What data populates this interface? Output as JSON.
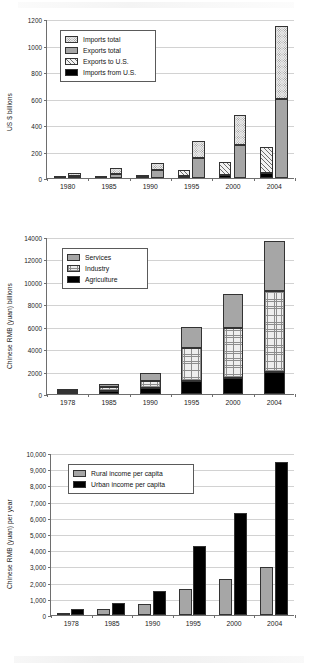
{
  "page": {
    "figure_count": 3
  },
  "chart_data": [
    {
      "id": "chart-trade",
      "type": "bar",
      "title": "",
      "xlabel": "",
      "ylabel": "US $ billions",
      "ylim": [
        0,
        1200
      ],
      "yticks": [
        0,
        200,
        400,
        600,
        800,
        1000,
        1200
      ],
      "ytick_labels": [
        "0",
        "200",
        "400",
        "600",
        "800",
        "1000",
        "1200"
      ],
      "grid": true,
      "legend_position": "upper-left",
      "categories": [
        "1980",
        "1985",
        "1990",
        "1995",
        "2000",
        "2004"
      ],
      "groups": [
        {
          "name": "US bilateral trade",
          "stacked": true,
          "series": [
            {
              "name": "Imports from U.S.",
              "pattern": "solid-black",
              "color": "#000000",
              "values": [
                1,
                3,
                5,
                16,
                22,
                38
              ]
            },
            {
              "name": "Exports to U.S.",
              "pattern": "diagonal-hatch",
              "color": "#f2f2f2",
              "values": [
                1,
                2,
                18,
                45,
                100,
                195
              ]
            }
          ]
        },
        {
          "name": "Total trade",
          "stacked": true,
          "series": [
            {
              "name": "Exports total",
              "pattern": "solid-gray",
              "color": "#a6a6a6",
              "values": [
                18,
                27,
                62,
                149,
                249,
                593
              ]
            },
            {
              "name": "Imports total",
              "pattern": "fine-dots",
              "color": "#ededed",
              "values": [
                20,
                45,
                53,
                132,
                225,
                553
              ]
            }
          ]
        }
      ],
      "legend_entries": [
        {
          "label": "Imports total",
          "pattern": "fine-dots"
        },
        {
          "label": "Exports total",
          "pattern": "solid-gray"
        },
        {
          "label": "Exports to U.S.",
          "pattern": "diagonal-hatch"
        },
        {
          "label": "Imports from U.S.",
          "pattern": "solid-black"
        }
      ]
    },
    {
      "id": "chart-gdp-sector",
      "type": "bar",
      "title": "",
      "xlabel": "",
      "ylabel": "Chinese RMB (yuan) billions",
      "ylim": [
        0,
        14000
      ],
      "yticks": [
        0,
        2000,
        4000,
        6000,
        8000,
        10000,
        12000,
        14000
      ],
      "ytick_labels": [
        "0",
        "2000",
        "4000",
        "6000",
        "8000",
        "10000",
        "12000",
        "14000"
      ],
      "grid": true,
      "legend_position": "upper-left",
      "categories": [
        "1978",
        "1985",
        "1990",
        "1995",
        "2000",
        "2004"
      ],
      "stacked": true,
      "series": [
        {
          "name": "Agriculture",
          "pattern": "solid-black",
          "color": "#000000",
          "values": [
            100,
            255,
            500,
            1200,
            1390,
            1920
          ]
        },
        {
          "name": "Industry",
          "pattern": "grid-hatch",
          "color": "#eeeeee",
          "values": [
            175,
            390,
            680,
            2870,
            4500,
            7230
          ]
        },
        {
          "name": "Services",
          "pattern": "solid-gray",
          "color": "#a6a6a6",
          "values": [
            90,
            260,
            680,
            1900,
            3030,
            4520
          ]
        }
      ],
      "legend_entries": [
        {
          "label": "Services",
          "pattern": "solid-gray"
        },
        {
          "label": "Industry",
          "pattern": "grid-hatch"
        },
        {
          "label": "Agriculture",
          "pattern": "solid-black"
        }
      ]
    },
    {
      "id": "chart-income",
      "type": "bar",
      "title": "",
      "xlabel": "",
      "ylabel": "Chinese RMB (yuan) per year",
      "ylim": [
        0,
        10000
      ],
      "yticks": [
        0,
        1000,
        2000,
        3000,
        4000,
        5000,
        6000,
        7000,
        8000,
        9000,
        10000
      ],
      "ytick_labels": [
        "0",
        "1,000",
        "2,000",
        "3,000",
        "4,000",
        "5,000",
        "6,000",
        "7,000",
        "8,000",
        "9,000",
        "10,000"
      ],
      "grid": true,
      "legend_position": "upper-left",
      "categories": [
        "1978",
        "1985",
        "1990",
        "1995",
        "2000",
        "2004"
      ],
      "stacked": false,
      "series": [
        {
          "name": "Rural income per capita",
          "pattern": "solid-gray",
          "color": "#a6a6a6",
          "values": [
            134,
            398,
            686,
            1578,
            2253,
            2936
          ]
        },
        {
          "name": "Urban income per capita",
          "pattern": "solid-black",
          "color": "#000000",
          "values": [
            343,
            739,
            1510,
            4283,
            6280,
            9422
          ]
        }
      ],
      "legend_entries": [
        {
          "label": "Rural income per capita",
          "pattern": "solid-gray"
        },
        {
          "label": "Urban income per capita",
          "pattern": "solid-black"
        }
      ]
    }
  ]
}
